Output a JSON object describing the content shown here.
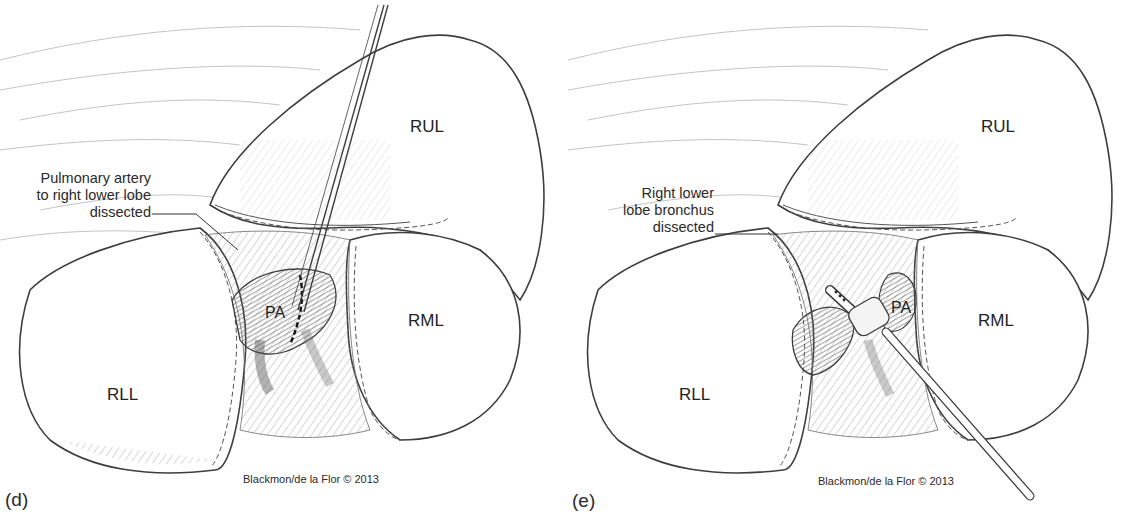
{
  "figure": {
    "panels": [
      {
        "id": "d",
        "panel_label": "(d)",
        "callout": [
          "Pulmonary artery",
          "to right lower lobe",
          "dissected"
        ],
        "labels": {
          "rul": "RUL",
          "rml": "RML",
          "rll": "RLL",
          "pa": "PA"
        },
        "credit": "Blackmon/de la Flor © 2013"
      },
      {
        "id": "e",
        "panel_label": "(e)",
        "callout": [
          "Right lower",
          "lobe bronchus",
          "dissected"
        ],
        "labels": {
          "rul": "RUL",
          "rml": "RML",
          "rll": "RLL",
          "pa": "PA"
        },
        "credit": "Blackmon/de la Flor © 2013"
      }
    ],
    "colors": {
      "line": "#4a4a4a",
      "shade": "#8c8c8c",
      "dark_shade": "#6a6a6a",
      "background": "#ffffff"
    }
  }
}
